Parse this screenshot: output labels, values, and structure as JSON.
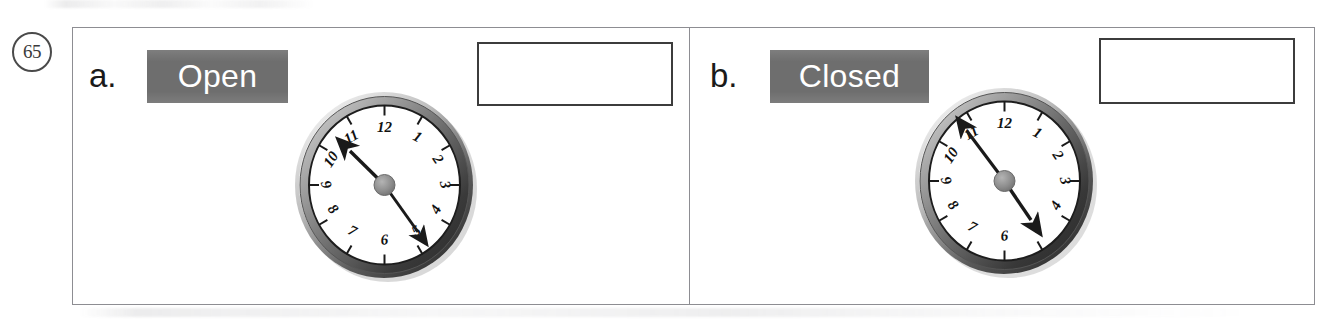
{
  "problem": {
    "number": "65"
  },
  "items": [
    {
      "letter": "a.",
      "keyword": "Open",
      "answer_value": "",
      "clock": {
        "hour_hand_points_to": 10.45,
        "minute_hand_points_to": 5,
        "numerals": [
          "12",
          "1",
          "2",
          "3",
          "4",
          "5",
          "6",
          "7",
          "8",
          "9",
          "10",
          "11"
        ]
      }
    },
    {
      "letter": "b.",
      "keyword": "Closed",
      "answer_value": "",
      "clock": {
        "hour_hand_points_to": 4.9,
        "minute_hand_points_to": 11,
        "numerals": [
          "12",
          "1",
          "2",
          "3",
          "4",
          "5",
          "6",
          "7",
          "8",
          "9",
          "10",
          "11"
        ]
      }
    }
  ],
  "colors": {
    "badge_background": "#6e6e6e",
    "badge_text": "#ffffff",
    "frame_border": "#8d8d92",
    "answer_box_border": "#3c3c3c",
    "clock_bezel_dark": "#2b2b2b",
    "clock_bezel_light": "#c9c9c9",
    "clock_face": "#ffffff",
    "clock_hand": "#1a1a1a",
    "clock_hub": "#8a8a8a"
  }
}
